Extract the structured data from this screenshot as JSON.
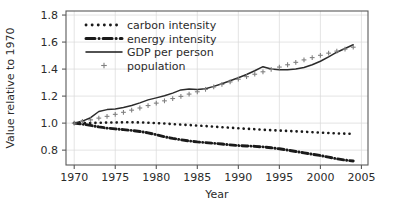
{
  "chart_data": {
    "type": "line",
    "title": "",
    "subtitle": "",
    "xlabel": "Year",
    "ylabel": "Value relative to 1970",
    "xlim": [
      1969.0,
      2005.8
    ],
    "ylim": [
      0.69,
      1.83
    ],
    "xticks": [
      1970,
      1975,
      1980,
      1985,
      1990,
      1995,
      2000,
      2005
    ],
    "xticklabels": [
      "1970",
      "1975",
      "1980",
      "1985",
      "1990",
      "1995",
      "2000",
      "2005"
    ],
    "yticks": [
      0.8,
      1.0,
      1.2,
      1.4,
      1.6,
      1.8
    ],
    "yticklabels": [
      "0.8",
      "1.0",
      "1.2",
      "1.4",
      "1.6",
      "1.8"
    ],
    "grid": true,
    "grid_color": "#d9d9d9",
    "legend_position": "upper left",
    "frame_color": "#5a5a5a",
    "x": [
      1970,
      1971,
      1972,
      1973,
      1974,
      1975,
      1976,
      1977,
      1978,
      1979,
      1980,
      1981,
      1982,
      1983,
      1984,
      1985,
      1986,
      1987,
      1988,
      1989,
      1990,
      1991,
      1992,
      1993,
      1994,
      1995,
      1996,
      1997,
      1998,
      1999,
      2000,
      2001,
      2002,
      2003,
      2004
    ],
    "series": [
      {
        "name": "carbon intensity",
        "style": "dotted",
        "color": "#1a1a1a",
        "marker": "none",
        "values": [
          1.0,
          1.0,
          1.001,
          1.003,
          1.004,
          1.005,
          1.006,
          1.006,
          1.005,
          1.003,
          1.0,
          0.997,
          0.993,
          0.989,
          0.986,
          0.982,
          0.978,
          0.974,
          0.97,
          0.966,
          0.962,
          0.958,
          0.955,
          0.951,
          0.948,
          0.945,
          0.942,
          0.939,
          0.936,
          0.933,
          0.93,
          0.927,
          0.924,
          0.922,
          0.921
        ]
      },
      {
        "name": "energy intensity",
        "style": "dashdot",
        "color": "#1a1a1a",
        "marker": "none",
        "values": [
          1.0,
          0.993,
          0.983,
          0.972,
          0.963,
          0.957,
          0.952,
          0.946,
          0.938,
          0.928,
          0.914,
          0.899,
          0.887,
          0.877,
          0.868,
          0.861,
          0.856,
          0.851,
          0.845,
          0.839,
          0.834,
          0.831,
          0.828,
          0.824,
          0.818,
          0.81,
          0.8,
          0.79,
          0.78,
          0.77,
          0.76,
          0.748,
          0.736,
          0.726,
          0.72
        ]
      },
      {
        "name": "GDP per person",
        "style": "solid",
        "color": "#2b2b2b",
        "marker": "none",
        "values": [
          1.0,
          1.015,
          1.04,
          1.086,
          1.1,
          1.104,
          1.116,
          1.13,
          1.15,
          1.172,
          1.187,
          1.203,
          1.222,
          1.246,
          1.252,
          1.248,
          1.255,
          1.272,
          1.292,
          1.314,
          1.336,
          1.36,
          1.388,
          1.418,
          1.4,
          1.396,
          1.395,
          1.4,
          1.412,
          1.432,
          1.458,
          1.49,
          1.525,
          1.552,
          1.58
        ]
      },
      {
        "name": "population",
        "style": "none",
        "color": "#808080",
        "marker": "plus",
        "values": [
          1.0,
          1.012,
          1.024,
          1.037,
          1.05,
          1.065,
          1.08,
          1.096,
          1.112,
          1.13,
          1.148,
          1.165,
          1.182,
          1.198,
          1.215,
          1.232,
          1.25,
          1.268,
          1.287,
          1.305,
          1.325,
          1.344,
          1.362,
          1.38,
          1.398,
          1.415,
          1.432,
          1.45,
          1.468,
          1.485,
          1.502,
          1.518,
          1.533,
          1.548,
          1.562
        ]
      }
    ],
    "legend": [
      {
        "label": "carbon intensity",
        "marker": "dotted-line"
      },
      {
        "label": "energy intensity",
        "marker": "dashdot-line"
      },
      {
        "label": "GDP per person",
        "marker": "solid-line"
      },
      {
        "label": "population",
        "marker": "plus-symbol"
      }
    ]
  }
}
